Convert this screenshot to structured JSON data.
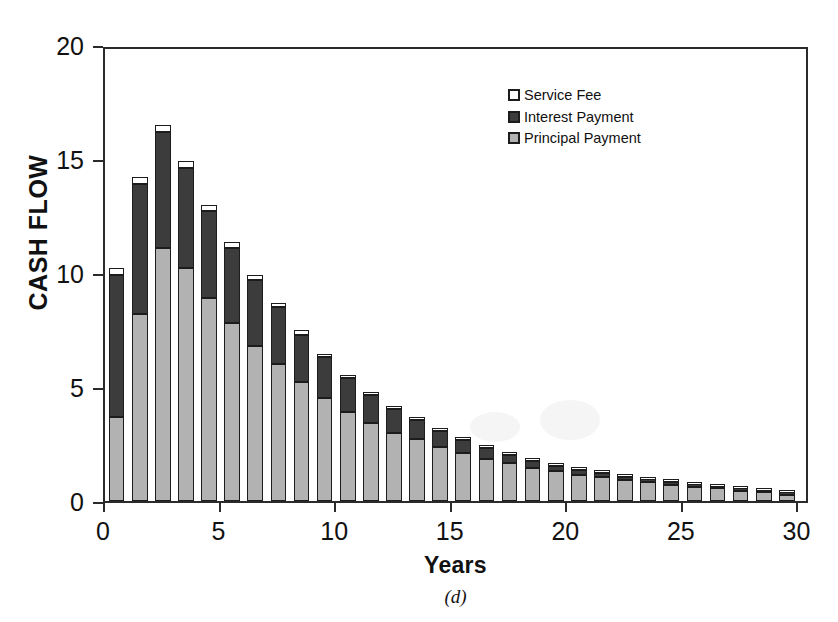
{
  "chart_data": {
    "type": "bar",
    "stacked": true,
    "title": "",
    "caption": "(d)",
    "xlabel": "Years",
    "ylabel": "CASH FLOW",
    "xlim": [
      0,
      30.5
    ],
    "ylim": [
      0,
      20
    ],
    "ytick_labels": [
      "0",
      "5",
      "10",
      "15",
      "20"
    ],
    "ytick_values": [
      0,
      5,
      10,
      15,
      20
    ],
    "xtick_labels": [
      "0",
      "5",
      "10",
      "15",
      "20",
      "25",
      "30"
    ],
    "xtick_values": [
      0,
      5,
      10,
      15,
      20,
      25,
      30
    ],
    "grid": false,
    "legend_position": "upper-right-inside",
    "categories": [
      1,
      2,
      3,
      4,
      5,
      6,
      7,
      8,
      9,
      10,
      11,
      12,
      13,
      14,
      15,
      16,
      17,
      18,
      19,
      20,
      21,
      22,
      23,
      24,
      25,
      26,
      27,
      28,
      29,
      30
    ],
    "series": [
      {
        "name": "Principal Payment",
        "color": "#b2b2b2",
        "values": [
          3.7,
          8.2,
          11.1,
          10.2,
          8.9,
          7.8,
          6.8,
          6.0,
          5.2,
          4.5,
          3.9,
          3.4,
          3.0,
          2.7,
          2.35,
          2.1,
          1.85,
          1.65,
          1.45,
          1.3,
          1.15,
          1.05,
          0.92,
          0.82,
          0.72,
          0.63,
          0.55,
          0.46,
          0.38,
          0.28
        ]
      },
      {
        "name": "Interest Payment",
        "color": "#3c3c3c",
        "values": [
          6.2,
          5.7,
          5.1,
          4.4,
          3.8,
          3.3,
          2.9,
          2.5,
          2.1,
          1.8,
          1.5,
          1.25,
          1.05,
          0.85,
          0.7,
          0.58,
          0.47,
          0.38,
          0.3,
          0.25,
          0.2,
          0.17,
          0.14,
          0.12,
          0.1,
          0.09,
          0.08,
          0.07,
          0.06,
          0.05
        ]
      },
      {
        "name": "Service Fee",
        "color": "#ffffff",
        "values": [
          0.3,
          0.3,
          0.3,
          0.3,
          0.3,
          0.25,
          0.2,
          0.2,
          0.18,
          0.16,
          0.14,
          0.12,
          0.1,
          0.09,
          0.08,
          0.07,
          0.06,
          0.05,
          0.05,
          0.04,
          0.04,
          0.03,
          0.03,
          0.03,
          0.02,
          0.02,
          0.02,
          0.02,
          0.02,
          0.02
        ]
      }
    ],
    "totals": [
      10.2,
      14.2,
      16.5,
      14.9,
      13.0,
      11.35,
      9.9,
      8.7,
      7.48,
      6.46,
      5.54,
      4.77,
      4.15,
      3.64,
      3.13,
      2.75,
      2.38,
      2.08,
      1.8,
      1.59,
      1.39,
      1.25,
      1.09,
      0.97,
      0.84,
      0.74,
      0.65,
      0.55,
      0.46,
      0.35
    ]
  },
  "legend": {
    "items": [
      {
        "label": "Service Fee",
        "color": "#ffffff"
      },
      {
        "label": "Interest Payment",
        "color": "#3c3c3c"
      },
      {
        "label": "Principal Payment",
        "color": "#b2b2b2"
      }
    ]
  }
}
